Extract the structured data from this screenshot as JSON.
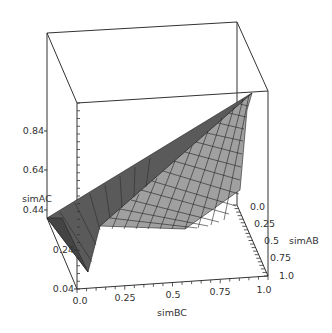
{
  "chart_data": {
    "type": "surface3d",
    "title": "",
    "x": {
      "label": "simBC",
      "ticks": [
        "0.0",
        "0.25",
        "0.5",
        "0.75",
        "1.0"
      ],
      "range": [
        0,
        1
      ]
    },
    "y": {
      "label": "simAB",
      "ticks": [
        "0.0",
        "0.25",
        "0.5",
        "0.75",
        "1.0"
      ],
      "range": [
        0,
        1
      ]
    },
    "z": {
      "label": "simAC",
      "ticks": [
        "0.04",
        "0.24",
        "0.44",
        "0.64",
        "0.84"
      ],
      "range": [
        0.04,
        1.0
      ]
    },
    "surface_samples": [
      {
        "simBC": 0.0,
        "simAB": 0.0,
        "simAC": 0.36
      },
      {
        "simBC": 0.0,
        "simAB": 1.0,
        "simAC": 0.12
      },
      {
        "simBC": 1.0,
        "simAB": 0.0,
        "simAC": 1.0
      },
      {
        "simBC": 1.0,
        "simAB": 1.0,
        "simAC": 0.36
      },
      {
        "simBC": 0.5,
        "simAB": 0.5,
        "simAC": 0.5
      }
    ],
    "grid": false,
    "legend": null,
    "colors": {
      "surface_face": "#999999",
      "surface_dark": "#555555",
      "mesh": "#222222",
      "box": "#333333"
    }
  },
  "labels": {
    "zaxis": "simAC",
    "xaxis": "simBC",
    "yaxis": "simAB",
    "z_ticks": [
      "0.84",
      "0.64",
      "0.44",
      "0.24",
      "0.04"
    ],
    "x_ticks": [
      "0.0",
      "0.25",
      "0.5",
      "0.75",
      "1.0"
    ],
    "y_ticks": [
      "0.0",
      "0.25",
      "0.5",
      "0.75",
      "1.0"
    ]
  }
}
